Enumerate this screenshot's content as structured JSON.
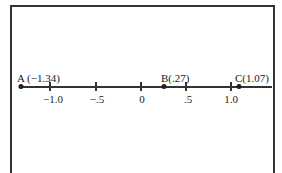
{
  "diagram": {
    "type": "number-line",
    "ticks": [
      {
        "value": -1.0,
        "label": "−1.0",
        "x": 50
      },
      {
        "value": -0.5,
        "label": "−.5",
        "x": 96
      },
      {
        "value": 0,
        "label": "0",
        "x": 141
      },
      {
        "value": 0.5,
        "label": ".5",
        "x": 186
      },
      {
        "value": 1.0,
        "label": "1.0",
        "x": 231
      }
    ],
    "points": [
      {
        "name": "A",
        "value": -1.34,
        "label": "A (−1.34)",
        "x": 20
      },
      {
        "name": "B",
        "value": 0.27,
        "label": "B(.27)",
        "x": 163
      },
      {
        "name": "C",
        "value": 1.07,
        "label": "C(1.07)",
        "x": 238
      }
    ]
  }
}
